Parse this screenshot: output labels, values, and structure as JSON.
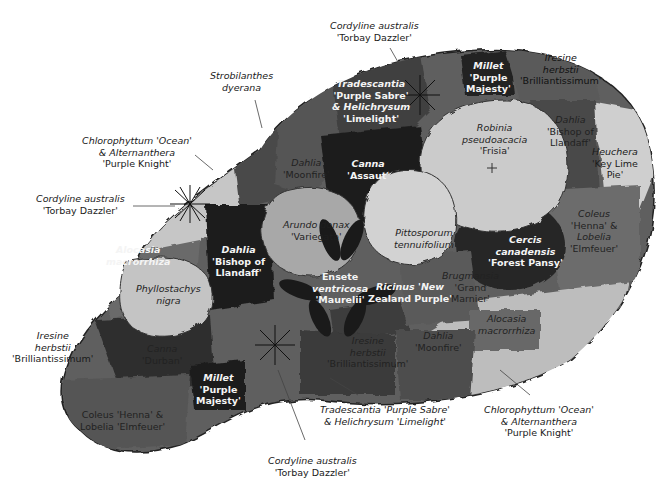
{
  "diagram": {
    "type": "planting-plan",
    "colors": {
      "border_outline": "#2a2a2a",
      "light_fill": "#c9c9c9",
      "mid_fill": "#7a7a7a",
      "dark_fill": "#3a3a3a",
      "darkest_fill": "#1e1e1e"
    },
    "outside_labels": [
      {
        "id": "cordyline-top",
        "lines": [
          "Cordyline australis",
          "'Torbay Dazzler'"
        ]
      },
      {
        "id": "strobilanthes",
        "lines": [
          "Strobilanthes",
          "dyerana"
        ]
      },
      {
        "id": "chlorophyttum-left",
        "lines": [
          "Chlorophyttum 'Ocean'",
          "& Alternanthera",
          "'Purple Knight'"
        ]
      },
      {
        "id": "cordyline-left",
        "lines": [
          "Cordyline australis",
          "'Torbay Dazzler'"
        ]
      },
      {
        "id": "iresine-left",
        "lines": [
          "Iresine",
          "herbstii",
          "'Brilliantissimum'"
        ]
      },
      {
        "id": "iresine-top-right",
        "lines": [
          "Iresine",
          "herbstii",
          "'Brilliantissimum'"
        ]
      },
      {
        "id": "heuchera",
        "lines": [
          "Heuchera",
          "'Key Lime",
          "Pie'"
        ]
      },
      {
        "id": "tradescantia-bottom",
        "lines": [
          "Tradescantia 'Purple Sabre'",
          "& Helichrysum 'Limelight'"
        ]
      },
      {
        "id": "chlorophyttum-bottom",
        "lines": [
          "Chlorophyttum 'Ocean'",
          "& Alternanthera",
          "'Purple Knight'"
        ]
      },
      {
        "id": "cordyline-bottom",
        "lines": [
          "Cordyline australis",
          "'Torbay Dazzler'"
        ]
      }
    ],
    "inside_labels": [
      {
        "id": "tradescantia-top",
        "lines": [
          "Tradescantia",
          "'Purple Sabre'",
          "& Helichrysum",
          "'Limelight'"
        ]
      },
      {
        "id": "millet-top",
        "lines": [
          "Millet",
          "'Purple",
          "Majesty'"
        ]
      },
      {
        "id": "robinia",
        "lines": [
          "Robinia",
          "pseudoacacia",
          "'Frisia'"
        ]
      },
      {
        "id": "dahlia-bishop-right",
        "lines": [
          "Dahlia",
          "'Bishop of",
          "Llandaff'"
        ]
      },
      {
        "id": "dahlia-moonfire-top",
        "lines": [
          "Dahlia",
          "'Moonfire'"
        ]
      },
      {
        "id": "canna-assaut",
        "lines": [
          "Canna",
          "'Assaut'"
        ]
      },
      {
        "id": "arundo",
        "lines": [
          "Arundo donax",
          "'Variegata'"
        ]
      },
      {
        "id": "pittosporum",
        "lines": [
          "Pittosporum",
          "tennuifolium"
        ]
      },
      {
        "id": "coleus-right",
        "lines": [
          "Coleus",
          "'Henna' &",
          "Lobelia",
          "'Elmfeuer'"
        ]
      },
      {
        "id": "cercis",
        "lines": [
          "Cercis",
          "canadensis",
          "'Forest Pansy'"
        ]
      },
      {
        "id": "alocasia-left",
        "lines": [
          "Alocasia",
          "macrorrhiza"
        ]
      },
      {
        "id": "dahlia-bishop-left",
        "lines": [
          "Dahlia",
          "'Bishop of",
          "Llandaff'"
        ]
      },
      {
        "id": "phyllostachys",
        "lines": [
          "Phyllostachys",
          "nigra"
        ]
      },
      {
        "id": "ensete",
        "lines": [
          "Ensete",
          "ventricosa",
          "'Maurelii'"
        ]
      },
      {
        "id": "ricinus",
        "lines": [
          "Ricinus 'New",
          "Zealand Purple'"
        ]
      },
      {
        "id": "brugmansia",
        "lines": [
          "Brugmansia",
          "'Grand",
          "Marnier'"
        ]
      },
      {
        "id": "alocasia-right",
        "lines": [
          "Alocasia",
          "macrorrhiza"
        ]
      },
      {
        "id": "dahlia-moonfire-bottom",
        "lines": [
          "Dahlia",
          "'Moonfire'"
        ]
      },
      {
        "id": "iresine-bottom",
        "lines": [
          "Iresine",
          "herbstii",
          "'Brilliantissimum'"
        ]
      },
      {
        "id": "canna-durban",
        "lines": [
          "Canna",
          "'Durban'"
        ]
      },
      {
        "id": "millet-bottom",
        "lines": [
          "Millet",
          "'Purple",
          "Majesty'"
        ]
      },
      {
        "id": "coleus-bottom",
        "lines": [
          "Coleus 'Henna' &",
          "Lobelia 'Elmfeuer'"
        ]
      }
    ]
  }
}
